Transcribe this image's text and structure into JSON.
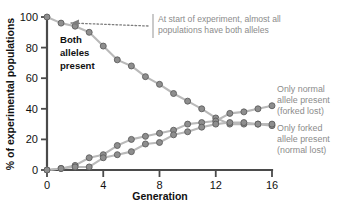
{
  "chart_data": {
    "type": "line",
    "title": "",
    "xlabel": "Generation",
    "ylabel": "% of experimental populations",
    "xlim": [
      0,
      16
    ],
    "ylim": [
      0,
      100
    ],
    "xticks": [
      0,
      4,
      8,
      12,
      16
    ],
    "xticklabels": [
      "0",
      "4",
      "8",
      "12",
      "16"
    ],
    "yticks": [
      0,
      20,
      40,
      60,
      80,
      100
    ],
    "yticklabels": [
      "0",
      "20",
      "40",
      "60",
      "80",
      "100"
    ],
    "grid": false,
    "legend_position": "inline-annotations",
    "x": [
      0,
      1,
      2,
      3,
      4,
      5,
      6,
      7,
      8,
      9,
      10,
      11,
      12,
      13,
      14,
      15,
      16
    ],
    "series": [
      {
        "name": "Both alleles present",
        "label": "Both alleles present",
        "values": [
          100,
          96,
          94,
          90,
          81,
          72,
          68,
          61,
          56,
          50,
          45,
          40,
          34,
          30,
          30,
          30,
          29
        ]
      },
      {
        "name": "Only normal allele present (forked lost)",
        "label": "Only normal allele present (forked lost)",
        "values": [
          0,
          1,
          3,
          8,
          10,
          16,
          20,
          22,
          24,
          26,
          30,
          31,
          32,
          37,
          38,
          40,
          42
        ]
      },
      {
        "name": "Only forked allele present (normal lost)",
        "label": "Only forked allele present (normal lost)",
        "values": [
          0,
          1,
          2,
          2,
          8,
          10,
          12,
          17,
          18,
          23,
          25,
          28,
          30,
          31,
          31,
          30,
          30
        ]
      }
    ],
    "annotations": [
      {
        "name": "start-of-experiment-note",
        "line1": "At start of experiment, almost all",
        "line2": "populations have both alleles",
        "points_to_x": 1,
        "points_to_y": 96
      },
      {
        "name": "both-alleles-inline-label",
        "line1": "Both",
        "line2": "alleles",
        "line3": "present"
      },
      {
        "name": "only-normal-side-label",
        "line1": "Only normal",
        "line2": "allele present",
        "line3": "(forked lost)"
      },
      {
        "name": "only-forked-side-label",
        "line1": "Only forked",
        "line2": "allele present",
        "line3": "(normal lost)"
      }
    ],
    "colors": {
      "line": "#b9b9b9",
      "marker_fill": "#8e8e8e",
      "marker_stroke": "#5e5e5e",
      "axis": "#4a4a4a",
      "annotation_text": "#8c8c8c",
      "primary_text": "#111111",
      "background": "#ffffff"
    }
  }
}
